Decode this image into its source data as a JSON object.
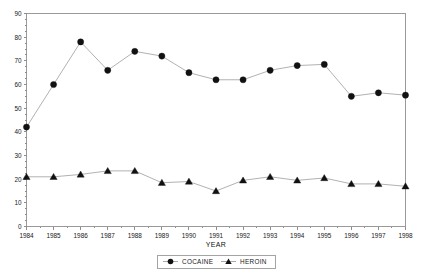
{
  "chart_data": {
    "type": "line",
    "title": "",
    "xlabel": "YEAR",
    "ylabel": "",
    "x": [
      1984,
      1985,
      1986,
      1987,
      1988,
      1989,
      1990,
      1991,
      1992,
      1993,
      1994,
      1995,
      1996,
      1997,
      1998
    ],
    "xtick_labels": [
      "1984",
      "1985",
      "1986",
      "1987",
      "1988",
      "1989",
      "1990",
      "1991",
      "1992",
      "1993",
      "1994",
      "1995",
      "1996",
      "1997",
      "1998"
    ],
    "ytick_labels": [
      "0",
      "10",
      "20",
      "30",
      "40",
      "50",
      "60",
      "70",
      "80",
      "90"
    ],
    "yticks": [
      0,
      10,
      20,
      30,
      40,
      50,
      60,
      70,
      80,
      90
    ],
    "ylim": [
      0,
      90
    ],
    "xlim": [
      1984,
      1998
    ],
    "grid": false,
    "legend_position": "bottom-center",
    "series": [
      {
        "name": "COCAINE",
        "marker": "circle",
        "color": "#111111",
        "line_color": "#a8a8a8",
        "values": [
          42,
          60,
          78,
          66,
          74,
          72,
          65,
          62,
          62,
          66,
          68,
          68.5,
          55,
          56.5,
          55.5
        ]
      },
      {
        "name": "HEROIN",
        "marker": "triangle",
        "color": "#111111",
        "line_color": "#a8a8a8",
        "values": [
          21,
          21,
          22,
          23.5,
          23.5,
          18.5,
          19,
          15,
          19.5,
          21,
          19.5,
          20.5,
          18,
          18,
          17
        ]
      }
    ]
  },
  "legend": {
    "items": [
      {
        "label": "COCAINE"
      },
      {
        "label": "HEROIN"
      }
    ]
  },
  "axis": {
    "x_title": "YEAR"
  }
}
